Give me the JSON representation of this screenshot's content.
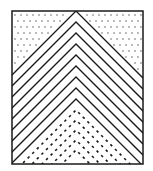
{
  "diagram": {
    "type": "chevron-pattern",
    "frame": {
      "x": 12,
      "y": 11,
      "width": 131,
      "height": 153,
      "stroke": "#1a1a1a",
      "stroke_width": 1.5
    },
    "apex_x": 76,
    "slope": 1.0,
    "solid_chevrons": {
      "count": 9,
      "first_apex_y": 11,
      "spacing": 11,
      "stroke": "#1a1a1a",
      "stroke_width": 1.3
    },
    "dashed_chevrons": {
      "count": 5,
      "first_apex_y": 110,
      "spacing": 10,
      "stroke": "#1a1a1a",
      "stroke_width": 1.6,
      "dash": "2.5 4"
    },
    "dot_fill": {
      "regions": [
        "top-left",
        "top-right"
      ],
      "color": "#444444",
      "spacing": 6,
      "radius": 0.7
    },
    "colors": {
      "background": "#ffffff",
      "ink": "#1a1a1a"
    }
  }
}
